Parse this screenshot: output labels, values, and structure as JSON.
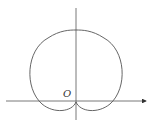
{
  "diagram": {
    "type": "polar-curve",
    "origin_label": "O",
    "axes": {
      "x_axis": {
        "has_arrow": true
      },
      "y_axis": {
        "has_arrow": false
      }
    },
    "colors": {
      "stroke": "#555555",
      "background": "#ffffff"
    }
  }
}
